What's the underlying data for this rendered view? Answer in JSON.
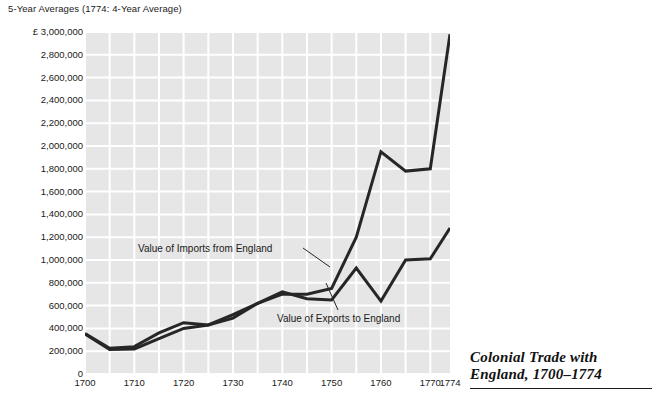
{
  "subtitle": "5-Year Averages (1774: 4-Year Average)",
  "title": {
    "line1": "Colonial Trade with",
    "line2": "England, 1700–1774"
  },
  "series_labels": {
    "imports": "Value of Imports from England",
    "exports": "Value of Exports to England"
  },
  "colors": {
    "plot_background": "#e6e6e6",
    "gridlines": "#ffffff",
    "line": "#262626",
    "text": "#1a1a1a"
  },
  "chart_data": {
    "type": "line",
    "title": "Colonial Trade with England, 1700–1774",
    "subtitle": "5-Year Averages (1774: 4-Year Average)",
    "xlabel": "",
    "ylabel": "£",
    "grid": true,
    "legend_position": "inline-annotations",
    "xlim": [
      1700,
      1774
    ],
    "ylim": [
      0,
      3000000
    ],
    "ytick_labels": [
      "£ 3,000,000",
      "2,800,000",
      "2,600,000",
      "2,400,000",
      "2,200,000",
      "2,000,000",
      "1,800,000",
      "1,600,000",
      "1,400,000",
      "1,200,000",
      "1,000,000",
      "800,000",
      "600,000",
      "400,000",
      "200,000",
      "0"
    ],
    "ytick_values": [
      3000000,
      2800000,
      2600000,
      2400000,
      2200000,
      2000000,
      1800000,
      1600000,
      1400000,
      1200000,
      1000000,
      800000,
      600000,
      400000,
      200000,
      0
    ],
    "xtick_labels": [
      "1700",
      "1710",
      "1720",
      "1730",
      "1740",
      "1750",
      "1760",
      "1770",
      "1774"
    ],
    "xtick_values": [
      1700,
      1710,
      1720,
      1730,
      1740,
      1750,
      1760,
      1770,
      1774
    ],
    "x": [
      1700,
      1705,
      1710,
      1715,
      1720,
      1725,
      1730,
      1735,
      1740,
      1745,
      1750,
      1755,
      1760,
      1765,
      1770,
      1774
    ],
    "series": [
      {
        "name": "Value of Imports from England",
        "values": [
          350000,
          215000,
          220000,
          310000,
          400000,
          430000,
          520000,
          620000,
          700000,
          700000,
          750000,
          1200000,
          1950000,
          1780000,
          1800000,
          2980000
        ]
      },
      {
        "name": "Value of Exports to England",
        "values": [
          355000,
          225000,
          240000,
          360000,
          450000,
          430000,
          490000,
          620000,
          720000,
          660000,
          650000,
          930000,
          640000,
          1000000,
          1010000,
          1280000
        ]
      }
    ]
  }
}
